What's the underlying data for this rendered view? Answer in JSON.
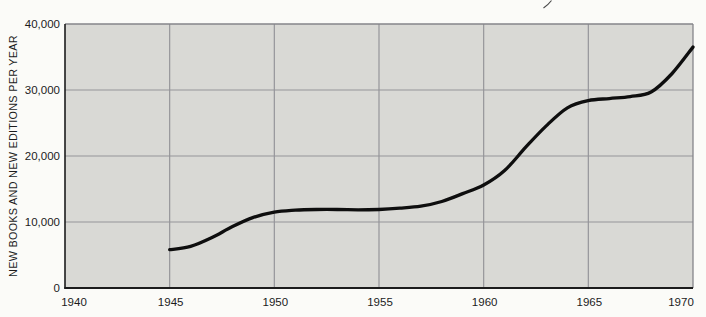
{
  "chart_data": {
    "type": "line",
    "title": "",
    "xlabel": "",
    "ylabel": "NEW BOOKS AND NEW EDITIONS PER YEAR",
    "xlim": [
      1940,
      1970
    ],
    "ylim": [
      0,
      40000
    ],
    "grid": true,
    "legend": "none",
    "xticks": [
      1940,
      1945,
      1950,
      1955,
      1960,
      1965,
      1970
    ],
    "xtick_labels": [
      "1940",
      "1945",
      "1950",
      "1955",
      "1960",
      "1965",
      "1970"
    ],
    "yticks": [
      0,
      10000,
      20000,
      30000,
      40000
    ],
    "ytick_labels": [
      "0",
      "10,000",
      "20,000",
      "30,000",
      "40,000"
    ],
    "series": [
      {
        "name": "new-books-and-new-editions-per-year",
        "x": [
          1945,
          1946,
          1947,
          1948,
          1949,
          1950,
          1951,
          1952,
          1953,
          1954,
          1955,
          1956,
          1957,
          1958,
          1959,
          1960,
          1961,
          1962,
          1963,
          1964,
          1965,
          1966,
          1967,
          1968,
          1969,
          1970
        ],
        "y": [
          5800,
          6300,
          7600,
          9300,
          10700,
          11500,
          11800,
          11900,
          11900,
          11850,
          11900,
          12100,
          12400,
          13100,
          14300,
          15600,
          17800,
          21300,
          24600,
          27300,
          28400,
          28700,
          29000,
          29700,
          32500,
          36500
        ]
      }
    ],
    "colors": {
      "line": "#0e0e0e",
      "plot_background": "#d9d9d5",
      "gridline": "#95959a",
      "frame": "#85858a",
      "axis": "#1c1c1c",
      "page_background": "#fbfbf8"
    }
  }
}
